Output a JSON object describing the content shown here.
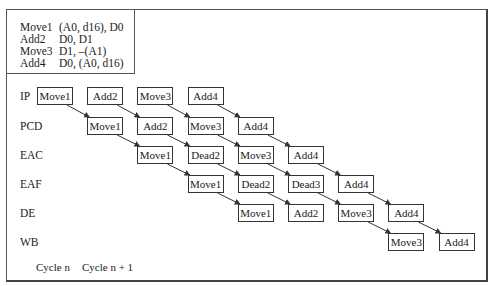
{
  "code_listing": [
    {
      "op": "Move1",
      "args": "(A0, d16), D0"
    },
    {
      "op": "Add2",
      "args": "D0, D1"
    },
    {
      "op": "Move3",
      "args": "D1, –(A1)"
    },
    {
      "op": "Add4",
      "args": "D0, (A0, d16)"
    }
  ],
  "stages": [
    {
      "label": "IP",
      "cells": [
        {
          "col": 0,
          "text": "Move1"
        },
        {
          "col": 1,
          "text": "Add2"
        },
        {
          "col": 2,
          "text": "Move3"
        },
        {
          "col": 3,
          "text": "Add4"
        }
      ]
    },
    {
      "label": "PCD",
      "cells": [
        {
          "col": 1,
          "text": "Move1"
        },
        {
          "col": 2,
          "text": "Add2"
        },
        {
          "col": 3,
          "text": "Move3"
        },
        {
          "col": 4,
          "text": "Add4"
        }
      ]
    },
    {
      "label": "EAC",
      "cells": [
        {
          "col": 2,
          "text": "Move1"
        },
        {
          "col": 3,
          "text": "Dead2"
        },
        {
          "col": 4,
          "text": "Move3"
        },
        {
          "col": 5,
          "text": "Add4"
        }
      ]
    },
    {
      "label": "EAF",
      "cells": [
        {
          "col": 3,
          "text": "Move1"
        },
        {
          "col": 4,
          "text": "Dead2"
        },
        {
          "col": 5,
          "text": "Dead3"
        },
        {
          "col": 6,
          "text": "Add4"
        }
      ]
    },
    {
      "label": "DE",
      "cells": [
        {
          "col": 4,
          "text": "Move1"
        },
        {
          "col": 5,
          "text": "Add2"
        },
        {
          "col": 6,
          "text": "Move3"
        },
        {
          "col": 7,
          "text": "Add4"
        }
      ]
    },
    {
      "label": "WB",
      "cells": [
        {
          "col": 7,
          "text": "Move3"
        },
        {
          "col": 8,
          "text": "Add4"
        }
      ]
    }
  ],
  "cycle_labels": [
    "Cycle n",
    "Cycle n + 1"
  ],
  "colors": {
    "line": "#333333",
    "background": "#ffffff"
  }
}
